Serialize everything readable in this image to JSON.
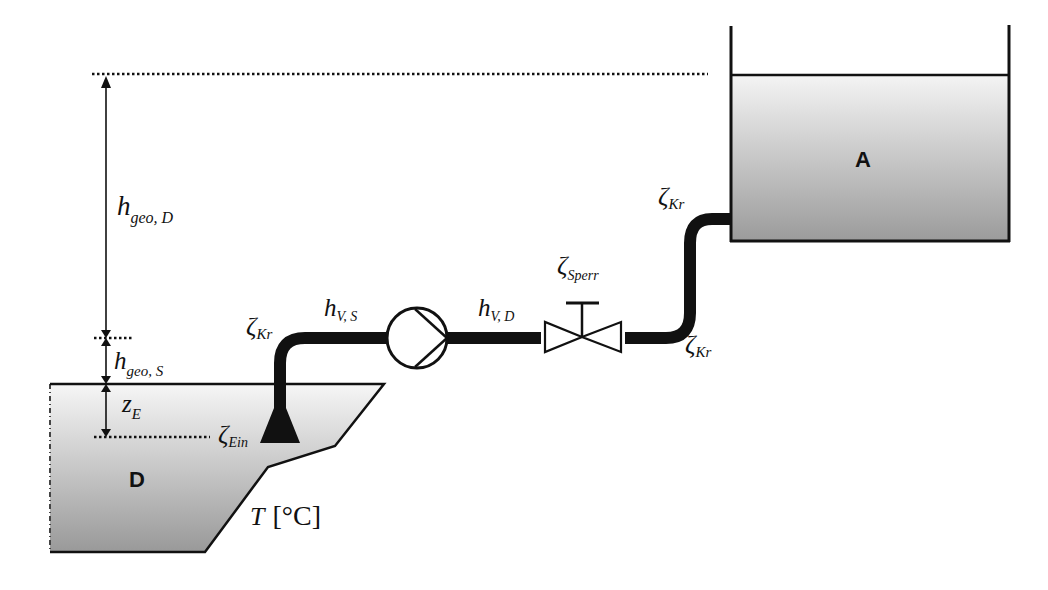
{
  "diagram": {
    "type": "pump-piping-system-schematic",
    "tanks": {
      "upper": {
        "label": "A"
      },
      "lower": {
        "label": "D"
      }
    },
    "labels": {
      "h_geo_D": {
        "main": "h",
        "sub": "geo, D"
      },
      "h_geo_S": {
        "main": "h",
        "sub": "geo, S"
      },
      "z_E": {
        "main": "z",
        "sub": "E"
      },
      "zeta_Ein": {
        "main": "ζ",
        "sub": "Ein"
      },
      "zeta_Kr_suction": {
        "main": "ζ",
        "sub": "Kr"
      },
      "h_V_S": {
        "main": "h",
        "sub": "V, S"
      },
      "h_V_D": {
        "main": "h",
        "sub": "V, D"
      },
      "zeta_Sperr": {
        "main": "ζ",
        "sub": "Sperr"
      },
      "zeta_Kr_upper": {
        "main": "ζ",
        "sub": "Kr"
      },
      "zeta_Kr_lower": {
        "main": "ζ",
        "sub": "Kr"
      },
      "temperature": {
        "main": "T",
        "unit": "[°C]"
      }
    },
    "components": [
      "suction-inlet",
      "bend-suction",
      "pump",
      "shutoff-valve",
      "bend-lower",
      "bend-upper"
    ],
    "colors": {
      "line": "#111111",
      "fluid_top": "#f2f2f2",
      "fluid_bottom": "#9a9a9a"
    }
  }
}
